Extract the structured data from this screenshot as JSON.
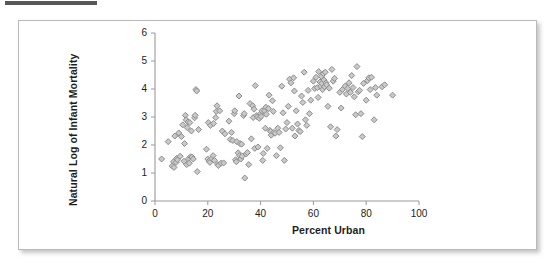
{
  "decor": {
    "top_rule_color": "#555759",
    "frame_border_color": "#b9b9b9"
  },
  "chart_data": {
    "type": "scatter",
    "title": "",
    "xlabel": "Percent Urban",
    "ylabel": "Natural Log of Infant Mortality",
    "xlim": [
      0,
      100
    ],
    "ylim": [
      0,
      6
    ],
    "xticks": [
      0,
      20,
      40,
      60,
      80,
      100
    ],
    "yticks": [
      0,
      1,
      2,
      3,
      4,
      5,
      6
    ],
    "grid": false,
    "legend": "none",
    "marker": {
      "shape": "diamond",
      "fill": "#c9c9c9",
      "stroke": "#8d8d8d",
      "size_px": 6
    },
    "series": [
      {
        "name": "Countries",
        "points": [
          [
            2.5,
            1.5
          ],
          [
            5.0,
            2.12
          ],
          [
            6.5,
            1.25
          ],
          [
            7.0,
            1.4
          ],
          [
            7.2,
            1.2
          ],
          [
            7.5,
            2.32
          ],
          [
            8.0,
            1.38
          ],
          [
            8.2,
            1.52
          ],
          [
            8.5,
            1.47
          ],
          [
            9.0,
            2.43
          ],
          [
            9.5,
            1.6
          ],
          [
            10.0,
            2.3
          ],
          [
            10.5,
            2.72
          ],
          [
            11.0,
            1.42
          ],
          [
            11.2,
            2.05
          ],
          [
            11.5,
            3.06
          ],
          [
            11.8,
            2.9
          ],
          [
            12.0,
            1.3
          ],
          [
            12.2,
            2.62
          ],
          [
            12.5,
            2.82
          ],
          [
            12.8,
            1.52
          ],
          [
            13.0,
            1.35
          ],
          [
            13.2,
            2.8
          ],
          [
            13.5,
            1.58
          ],
          [
            13.8,
            2.5
          ],
          [
            14.0,
            1.57
          ],
          [
            14.5,
            1.5
          ],
          [
            15.0,
            2.97
          ],
          [
            15.2,
            3.06
          ],
          [
            15.5,
            3.98
          ],
          [
            15.8,
            3.93
          ],
          [
            16.0,
            1.05
          ],
          [
            16.5,
            2.55
          ],
          [
            19.5,
            1.85
          ],
          [
            20.0,
            1.5
          ],
          [
            20.2,
            2.8
          ],
          [
            20.5,
            1.43
          ],
          [
            20.8,
            1.38
          ],
          [
            21.0,
            2.7
          ],
          [
            21.5,
            1.52
          ],
          [
            22.0,
            1.62
          ],
          [
            22.2,
            2.77
          ],
          [
            22.5,
            1.45
          ],
          [
            23.0,
            2.98
          ],
          [
            23.2,
            3.2
          ],
          [
            23.5,
            3.4
          ],
          [
            23.8,
            1.3
          ],
          [
            24.0,
            1.27
          ],
          [
            24.5,
            3.22
          ],
          [
            25.0,
            1.35
          ],
          [
            25.5,
            2.5
          ],
          [
            26.0,
            1.36
          ],
          [
            26.5,
            2.4
          ],
          [
            28.0,
            2.85
          ],
          [
            28.5,
            2.2
          ],
          [
            29.0,
            2.45
          ],
          [
            29.5,
            2.16
          ],
          [
            30.0,
            3.12
          ],
          [
            30.2,
            3.22
          ],
          [
            30.5,
            1.47
          ],
          [
            30.8,
            1.4
          ],
          [
            31.0,
            2.12
          ],
          [
            31.5,
            1.72
          ],
          [
            31.8,
            3.75
          ],
          [
            32.0,
            1.62
          ],
          [
            32.2,
            2.05
          ],
          [
            32.5,
            1.5
          ],
          [
            32.8,
            2.03
          ],
          [
            33.0,
            1.6
          ],
          [
            33.5,
            3.05
          ],
          [
            33.8,
            3.12
          ],
          [
            34.0,
            0.82
          ],
          [
            34.5,
            1.68
          ],
          [
            35.0,
            1.73
          ],
          [
            35.5,
            1.3
          ],
          [
            36.0,
            3.48
          ],
          [
            36.5,
            2.22
          ],
          [
            37.0,
            3.4
          ],
          [
            37.2,
            2.98
          ],
          [
            37.5,
            3.28
          ],
          [
            37.8,
            1.88
          ],
          [
            38.0,
            4.12
          ],
          [
            38.5,
            3.05
          ],
          [
            38.8,
            3.0
          ],
          [
            39.0,
            1.93
          ],
          [
            39.5,
            2.95
          ],
          [
            40.0,
            3.12
          ],
          [
            40.2,
            3.02
          ],
          [
            40.5,
            3.22
          ],
          [
            40.8,
            1.45
          ],
          [
            41.0,
            1.7
          ],
          [
            41.5,
            3.22
          ],
          [
            41.8,
            2.6
          ],
          [
            42.0,
            3.35
          ],
          [
            42.2,
            3.1
          ],
          [
            42.5,
            1.88
          ],
          [
            43.0,
            3.3
          ],
          [
            43.2,
            3.78
          ],
          [
            43.5,
            2.52
          ],
          [
            43.8,
            2.48
          ],
          [
            44.0,
            2.35
          ],
          [
            44.5,
            3.58
          ],
          [
            44.8,
            3.2
          ],
          [
            45.0,
            2.45
          ],
          [
            45.5,
            2.42
          ],
          [
            46.0,
            1.62
          ],
          [
            46.5,
            2.6
          ],
          [
            47.0,
            2.45
          ],
          [
            47.5,
            1.9
          ],
          [
            48.0,
            4.1
          ],
          [
            48.5,
            3.15
          ],
          [
            49.0,
            1.45
          ],
          [
            49.5,
            2.57
          ],
          [
            50.0,
            2.8
          ],
          [
            50.5,
            3.38
          ],
          [
            51.0,
            4.35
          ],
          [
            51.5,
            4.22
          ],
          [
            52.0,
            2.6
          ],
          [
            52.5,
            4.4
          ],
          [
            52.8,
            3.93
          ],
          [
            53.0,
            2.32
          ],
          [
            53.5,
            3.22
          ],
          [
            54.0,
            2.75
          ],
          [
            54.5,
            2.52
          ],
          [
            55.0,
            2.48
          ],
          [
            55.5,
            3.75
          ],
          [
            56.0,
            3.52
          ],
          [
            56.5,
            4.6
          ],
          [
            57.0,
            2.9
          ],
          [
            57.5,
            2.7
          ],
          [
            58.0,
            3.95
          ],
          [
            58.5,
            3.12
          ],
          [
            59.0,
            3.6
          ],
          [
            60.0,
            4.28
          ],
          [
            60.5,
            4.02
          ],
          [
            61.0,
            4.42
          ],
          [
            61.5,
            4.05
          ],
          [
            61.8,
            3.7
          ],
          [
            62.0,
            4.62
          ],
          [
            62.5,
            4.25
          ],
          [
            62.8,
            4.1
          ],
          [
            63.0,
            4.45
          ],
          [
            63.2,
            4.2
          ],
          [
            63.5,
            3.98
          ],
          [
            63.8,
            4.55
          ],
          [
            64.0,
            4.32
          ],
          [
            64.2,
            4.08
          ],
          [
            64.5,
            4.6
          ],
          [
            64.8,
            4.22
          ],
          [
            65.0,
            4.15
          ],
          [
            65.5,
            3.38
          ],
          [
            66.0,
            4.03
          ],
          [
            66.5,
            2.65
          ],
          [
            67.0,
            4.7
          ],
          [
            67.5,
            4.28
          ],
          [
            68.0,
            4.38
          ],
          [
            68.5,
            2.32
          ],
          [
            69.0,
            2.55
          ],
          [
            70.0,
            3.88
          ],
          [
            70.5,
            3.32
          ],
          [
            71.0,
            3.98
          ],
          [
            72.0,
            4.1
          ],
          [
            72.5,
            3.82
          ],
          [
            73.0,
            4.02
          ],
          [
            73.5,
            4.22
          ],
          [
            74.0,
            3.88
          ],
          [
            74.5,
            4.48
          ],
          [
            75.0,
            4.05
          ],
          [
            75.5,
            3.72
          ],
          [
            76.0,
            3.08
          ],
          [
            76.5,
            4.8
          ],
          [
            77.0,
            3.9
          ],
          [
            77.5,
            3.95
          ],
          [
            78.0,
            3.12
          ],
          [
            78.5,
            2.3
          ],
          [
            79.0,
            4.2
          ],
          [
            80.0,
            3.6
          ],
          [
            80.5,
            4.3
          ],
          [
            81.0,
            4.4
          ],
          [
            81.5,
            3.98
          ],
          [
            82.0,
            4.42
          ],
          [
            83.0,
            2.9
          ],
          [
            83.5,
            4.05
          ],
          [
            84.0,
            3.78
          ],
          [
            86.0,
            4.08
          ],
          [
            87.0,
            4.15
          ],
          [
            90.0,
            3.78
          ]
        ]
      }
    ]
  }
}
